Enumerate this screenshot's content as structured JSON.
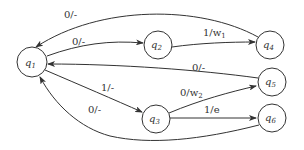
{
  "diagram": {
    "type": "state-machine",
    "nodes": [
      {
        "id": "q1",
        "label": "q",
        "sub": "1",
        "cx": 32,
        "cy": 62,
        "r": 15
      },
      {
        "id": "q2",
        "label": "q",
        "sub": "2",
        "cx": 158,
        "cy": 45,
        "r": 14
      },
      {
        "id": "q3",
        "label": "q",
        "sub": "3",
        "cx": 156,
        "cy": 119,
        "r": 14
      },
      {
        "id": "q4",
        "label": "q",
        "sub": "4",
        "cx": 270,
        "cy": 45,
        "r": 14
      },
      {
        "id": "q5",
        "label": "q",
        "sub": "5",
        "cx": 272,
        "cy": 82,
        "r": 14
      },
      {
        "id": "q6",
        "label": "q",
        "sub": "6",
        "cx": 272,
        "cy": 118,
        "r": 14
      }
    ],
    "edges": [
      {
        "from": "q4",
        "to": "q1",
        "label": "0/-"
      },
      {
        "from": "q1",
        "to": "q2",
        "label": "0/-"
      },
      {
        "from": "q2",
        "to": "q4",
        "label": "1/w",
        "label_sub": "1"
      },
      {
        "from": "q5",
        "to": "q1",
        "label": "0/-"
      },
      {
        "from": "q1",
        "to": "q3",
        "label": "1/-"
      },
      {
        "from": "q3",
        "to": "q5",
        "label": "0/w",
        "label_sub": "2"
      },
      {
        "from": "q3",
        "to": "q6",
        "label": "1/e"
      },
      {
        "from": "q6",
        "to": "q1",
        "label": "0/-"
      }
    ]
  }
}
